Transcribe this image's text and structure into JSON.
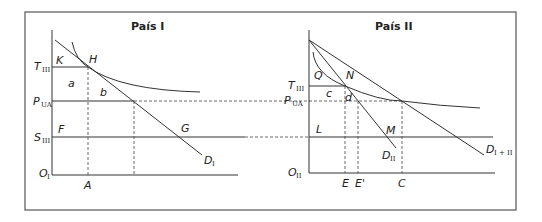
{
  "panels": {
    "left": {
      "title": "País I",
      "y_labels": {
        "t": {
          "main": "T",
          "sub": "III"
        },
        "p": {
          "main": "P",
          "sub": "UA"
        },
        "s": {
          "main": "S",
          "sub": "III"
        },
        "o": {
          "main": "O",
          "sub": "I"
        }
      },
      "x_labels": {
        "a": "A"
      },
      "points": {
        "k": "K",
        "h": "H",
        "a_area": "a",
        "b_area": "b",
        "f": "F",
        "g": "G"
      },
      "curve_label": {
        "main": "D",
        "sub": "I"
      }
    },
    "right": {
      "title": "País II",
      "y_labels": {
        "t": {
          "main": "T",
          "sub": "III"
        },
        "p": {
          "main": "P",
          "sub": "UA"
        },
        "o": {
          "main": "O",
          "sub": "II"
        }
      },
      "x_labels": {
        "e": "E",
        "e_prime": "E'",
        "c": "C"
      },
      "points": {
        "q": "Q",
        "n": "N",
        "c_area": "c",
        "d_area": "d",
        "l": "L",
        "m": "M"
      },
      "curve_labels": {
        "d2": {
          "main": "D",
          "sub": "II"
        },
        "d12": {
          "main": "D",
          "sub": "I + II"
        }
      }
    }
  }
}
